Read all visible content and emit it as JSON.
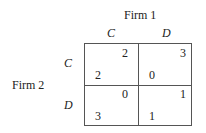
{
  "column_player": "Firm 1",
  "row_player": "Firm 2",
  "column_strategies": [
    "C",
    "D"
  ],
  "row_strategies": [
    "C",
    "D"
  ],
  "payoffs": [
    [
      {
        "firm1": "2",
        "firm2": "2"
      },
      {
        "firm1": "3",
        "firm2": "0"
      }
    ],
    [
      {
        "firm1": "0",
        "firm2": "3"
      },
      {
        "firm1": "1",
        "firm2": "1"
      }
    ]
  ]
}
